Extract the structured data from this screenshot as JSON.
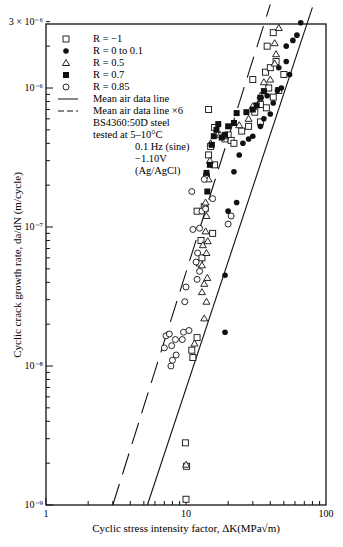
{
  "chart_data": {
    "type": "scatter",
    "title": "",
    "xlabel": "Cyclic stress intensity factor, ΔK(MPa√m)",
    "ylabel": "Cyclic crack growth rate, da/dN (m/cycle)",
    "xscale": "log",
    "yscale": "log",
    "xlim": [
      1,
      100
    ],
    "ylim": [
      1e-09,
      3e-06
    ],
    "x_ticks": [
      {
        "v": 1,
        "label": "1"
      },
      {
        "v": 10,
        "label": "10"
      },
      {
        "v": 100,
        "label": "100"
      }
    ],
    "y_ticks": [
      {
        "v": 3e-06,
        "label": "3 × 10⁻⁶"
      },
      {
        "v": 1e-06,
        "label": "10⁻⁶"
      },
      {
        "v": 1e-07,
        "label": "10⁻⁷"
      },
      {
        "v": 1e-08,
        "label": "10⁻⁸"
      },
      {
        "v": 1e-09,
        "label": "10⁻⁹"
      }
    ],
    "grid": false,
    "legend_position": "upper-left",
    "legend": [
      {
        "marker": "open-square",
        "label": "R = −1"
      },
      {
        "marker": "filled-circle",
        "label": "R = 0 to 0.1"
      },
      {
        "marker": "open-triangle",
        "label": "R = 0.5"
      },
      {
        "marker": "filled-square",
        "label": "R = 0.7"
      },
      {
        "marker": "open-circle",
        "label": "R = 0.85"
      },
      {
        "marker": "solid-line",
        "label": "Mean air data line"
      },
      {
        "marker": "dashed-line",
        "label": "Mean air data line ×6"
      }
    ],
    "annotations": [
      "BS4360:50D steel",
      "tested at 5–10°C",
      "0.1 Hz (sine)",
      "−1.10V",
      "(Ag/AgCl)"
    ],
    "lines": [
      {
        "name": "Mean air data line",
        "style": "solid",
        "points": [
          [
            5.3,
            1e-09
          ],
          [
            80,
            3.8e-06
          ]
        ]
      },
      {
        "name": "Mean air data line ×6",
        "style": "dashed",
        "points": [
          [
            3.0,
            1e-09
          ],
          [
            40,
            4e-06
          ]
        ]
      }
    ],
    "series": [
      {
        "name": "R = −1",
        "marker": "open-square",
        "points": [
          [
            10.0,
            1.1e-09
          ],
          [
            9.9,
            2.8e-09
          ],
          [
            10.1,
            1.9e-09
          ],
          [
            11.2,
            1.15e-08
          ],
          [
            11.0,
            1.3e-08
          ],
          [
            12.0,
            1.6e-08
          ],
          [
            12.5,
            5.5e-08
          ],
          [
            13.0,
            6e-08
          ],
          [
            12.8,
            8e-08
          ],
          [
            12.0,
            1.3e-07
          ],
          [
            13.5,
            1.4e-07
          ],
          [
            15.5,
            9e-08
          ],
          [
            14.0,
            2.3e-07
          ],
          [
            16.0,
            2.8e-07
          ],
          [
            14.5,
            3.3e-07
          ],
          [
            15.0,
            3.8e-07
          ],
          [
            16.0,
            5.2e-07
          ],
          [
            14.5,
            7e-07
          ],
          [
            19.0,
            4.3e-07
          ],
          [
            20.0,
            4.6e-07
          ],
          [
            21.0,
            4.2e-07
          ],
          [
            22.0,
            4e-07
          ],
          [
            25.0,
            4.9e-07
          ],
          [
            28.0,
            5.3e-07
          ],
          [
            34.0,
            5.7e-07
          ],
          [
            31.0,
            6.7e-07
          ],
          [
            34.0,
            7.6e-07
          ],
          [
            37.5,
            7.2e-07
          ],
          [
            42.0,
            8.6e-07
          ],
          [
            46.0,
            9.6e-07
          ],
          [
            30.0,
            1.15e-06
          ],
          [
            37.0,
            1.3e-06
          ],
          [
            40.0,
            1.4e-06
          ],
          [
            44.0,
            1.55e-06
          ],
          [
            38.0,
            2e-06
          ],
          [
            42.0,
            2.5e-06
          ],
          [
            39.0,
            1e-06
          ],
          [
            50.0,
            1.25e-06
          ]
        ]
      },
      {
        "name": "R = 0 to 0.1",
        "marker": "filled-circle",
        "points": [
          [
            19.0,
            1.75e-08
          ],
          [
            19.0,
            4.5e-08
          ],
          [
            20.0,
            1.3e-07
          ],
          [
            23.0,
            1.5e-07
          ],
          [
            22.0,
            2.5e-07
          ],
          [
            24.0,
            3.3e-07
          ],
          [
            25.5,
            4e-07
          ],
          [
            28.0,
            4.3e-07
          ],
          [
            30.0,
            4.5e-07
          ],
          [
            34.0,
            5.3e-07
          ],
          [
            36.0,
            6e-07
          ],
          [
            40.0,
            6.5e-07
          ],
          [
            42.0,
            7.8e-07
          ],
          [
            38.0,
            8.8e-07
          ],
          [
            45.0,
            9.6e-07
          ],
          [
            48.0,
            1e-06
          ],
          [
            46.0,
            1.4e-06
          ],
          [
            52.0,
            1.55e-06
          ],
          [
            55.0,
            1.25e-06
          ],
          [
            52.0,
            2e-06
          ],
          [
            58.0,
            2.2e-06
          ],
          [
            62.0,
            2.4e-06
          ],
          [
            66.0,
            2.95e-06
          ]
        ]
      },
      {
        "name": "R = 0.5",
        "marker": "open-triangle",
        "points": [
          [
            10.0,
            1.95e-09
          ],
          [
            11.5,
            1.45e-08
          ],
          [
            13.5,
            2.2e-08
          ],
          [
            14.0,
            2.9e-08
          ],
          [
            13.0,
            3.4e-08
          ],
          [
            13.5,
            3.9e-08
          ],
          [
            14.2,
            4.3e-08
          ],
          [
            13.0,
            5.3e-08
          ],
          [
            14.0,
            6.5e-08
          ],
          [
            13.2,
            7.4e-08
          ],
          [
            14.3,
            7.9e-08
          ],
          [
            13.8,
            9.3e-08
          ],
          [
            14.0,
            1.2e-07
          ],
          [
            13.8,
            1.5e-07
          ],
          [
            14.5,
            2.2e-07
          ],
          [
            14.8,
            3e-07
          ],
          [
            15.0,
            4e-07
          ],
          [
            17.5,
            4.6e-07
          ],
          [
            19.0,
            4.5e-07
          ],
          [
            24.0,
            5.4e-07
          ],
          [
            28.0,
            6e-07
          ],
          [
            30.0,
            7.4e-07
          ],
          [
            34.0,
            8.8e-07
          ],
          [
            36.0,
            1.1e-06
          ],
          [
            40.0,
            1.15e-06
          ],
          [
            43.0,
            1.5e-06
          ],
          [
            44.0,
            1.75e-06
          ],
          [
            43.0,
            2.1e-06
          ],
          [
            46.0,
            2.7e-06
          ]
        ]
      },
      {
        "name": "R = 0.7",
        "marker": "filled-square",
        "points": [
          [
            13.8,
            1.35e-07
          ],
          [
            14.2,
            1.8e-07
          ],
          [
            14.0,
            2.45e-07
          ],
          [
            14.8,
            2.8e-07
          ],
          [
            15.3,
            3.9e-07
          ],
          [
            15.8,
            4.5e-07
          ],
          [
            16.5,
            5e-07
          ],
          [
            17.0,
            5.5e-07
          ],
          [
            18.0,
            4.4e-07
          ],
          [
            19.0,
            4.6e-07
          ],
          [
            20.0,
            5.3e-07
          ],
          [
            22.0,
            5.6e-07
          ],
          [
            23.0,
            6.6e-07
          ],
          [
            27.0,
            6.7e-07
          ],
          [
            30.0,
            7e-07
          ],
          [
            32.0,
            7.5e-07
          ],
          [
            34.0,
            8.5e-07
          ],
          [
            36.0,
            9.5e-07
          ]
        ]
      },
      {
        "name": "R = 0.85",
        "marker": "open-circle",
        "points": [
          [
            7.8,
            1e-08
          ],
          [
            8.0,
            1.1e-08
          ],
          [
            7.9,
            1.4e-08
          ],
          [
            8.5,
            1.2e-08
          ],
          [
            7.0,
            1.35e-08
          ],
          [
            7.2,
            1.65e-08
          ],
          [
            7.6,
            1.7e-08
          ],
          [
            8.4,
            1.55e-08
          ],
          [
            9.6,
            1.75e-08
          ],
          [
            9.4,
            1.55e-08
          ],
          [
            10.5,
            1.8e-08
          ],
          [
            9.8,
            2.9e-08
          ],
          [
            10.0,
            3.7e-08
          ],
          [
            12.0,
            4.2e-08
          ],
          [
            12.5,
            4.8e-08
          ],
          [
            11.8,
            5.6e-08
          ],
          [
            12.1,
            6.5e-08
          ],
          [
            11.2,
            9.6e-08
          ],
          [
            12.5,
            9.8e-08
          ],
          [
            13.0,
            1.3e-07
          ],
          [
            13.8,
            1.35e-07
          ],
          [
            15.5,
            1.6e-07
          ],
          [
            20.0,
            1.05e-07
          ],
          [
            21.0,
            1.2e-07
          ],
          [
            11.0,
            1.8e-07
          ],
          [
            13.5,
            2.2e-07
          ]
        ]
      }
    ]
  }
}
